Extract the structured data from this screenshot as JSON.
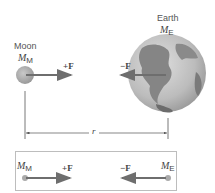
{
  "moon": {
    "name": "Moon",
    "mass_symbol": "M",
    "mass_sub": "M"
  },
  "earth": {
    "name": "Earth",
    "mass_symbol": "M",
    "mass_sub": "E"
  },
  "forces": {
    "on_moon": "+F",
    "on_earth": "−F"
  },
  "distance_label": "r",
  "free_body": {
    "left_mass_symbol": "M",
    "left_mass_sub": "M",
    "right_mass_symbol": "M",
    "right_mass_sub": "E",
    "left_force": "+F",
    "right_force": "−F"
  },
  "colors": {
    "arrow": "#6e6e6e",
    "moon": "#a9a9a9",
    "earth_ocean": "#bdbdbd",
    "earth_land": "#7a7a7a",
    "box_border": "#bdbdbd"
  }
}
